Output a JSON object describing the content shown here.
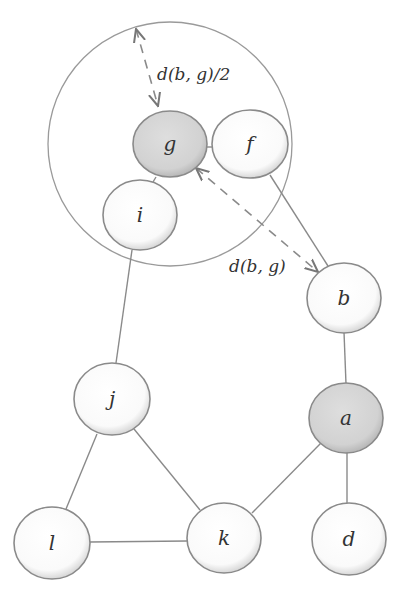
{
  "diagram": {
    "type": "graph",
    "colors": {
      "node_fill": "#ffffff",
      "highlight_fill": "#d4d4d4",
      "stroke": "#8a8a8a",
      "text": "#333333"
    },
    "region_circle": {
      "center_node": "g",
      "cx": 170,
      "cy": 144,
      "r": 122
    },
    "nodes": [
      {
        "id": "g",
        "label": "g",
        "cx": 170,
        "cy": 144,
        "highlighted": true
      },
      {
        "id": "f",
        "label": "f",
        "cx": 250,
        "cy": 144,
        "highlighted": false
      },
      {
        "id": "i",
        "label": "i",
        "cx": 140,
        "cy": 215,
        "highlighted": false
      },
      {
        "id": "b",
        "label": "b",
        "cx": 344,
        "cy": 298,
        "highlighted": false
      },
      {
        "id": "j",
        "label": "j",
        "cx": 112,
        "cy": 399,
        "highlighted": false
      },
      {
        "id": "a",
        "label": "a",
        "cx": 346,
        "cy": 418,
        "highlighted": true
      },
      {
        "id": "l",
        "label": "l",
        "cx": 52,
        "cy": 543,
        "highlighted": false
      },
      {
        "id": "k",
        "label": "k",
        "cx": 224,
        "cy": 538,
        "highlighted": false
      },
      {
        "id": "d",
        "label": "d",
        "cx": 349,
        "cy": 539,
        "highlighted": false
      }
    ],
    "edges": [
      [
        "g",
        "f"
      ],
      [
        "g",
        "i"
      ],
      [
        "f",
        "b"
      ],
      [
        "i",
        "j"
      ],
      [
        "b",
        "a"
      ],
      [
        "a",
        "k"
      ],
      [
        "a",
        "d"
      ],
      [
        "j",
        "l"
      ],
      [
        "j",
        "k"
      ],
      [
        "l",
        "k"
      ]
    ],
    "annotations": {
      "radius_label": "d(b, g)/2",
      "distance_label": "d(b, g)"
    }
  }
}
